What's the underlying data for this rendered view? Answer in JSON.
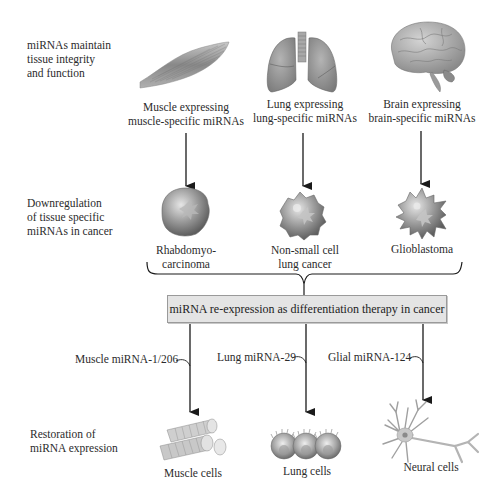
{
  "row_labels": {
    "top": [
      "miRNAs maintain",
      "tissue integrity",
      "and function"
    ],
    "middle": [
      "Downregulation",
      "of tissue specific",
      "miRNAs in cancer"
    ],
    "bottom": [
      "Restoration of",
      "miRNA expression"
    ]
  },
  "tissues": [
    {
      "icon": "muscle-icon",
      "caption": [
        "Muscle expressing",
        "muscle-specific miRNAs"
      ]
    },
    {
      "icon": "lungs-icon",
      "caption": [
        "Lung expressing",
        "lung-specific miRNAs"
      ]
    },
    {
      "icon": "brain-icon",
      "caption": [
        "Brain expressing",
        "brain-specific miRNAs"
      ]
    }
  ],
  "cancers": [
    {
      "icon": "rhabdomyosarcoma-cell-icon",
      "caption": [
        "Rhabdomyo-",
        "carcinoma"
      ]
    },
    {
      "icon": "nsclc-cell-icon",
      "caption": [
        "Non-small cell",
        "lung cancer"
      ]
    },
    {
      "icon": "glioblastoma-cell-icon",
      "caption": [
        "Glioblastoma"
      ]
    }
  ],
  "therapy_box": "miRNA re-expression as differentiation therapy in cancer",
  "mirnas": [
    {
      "label": "Muscle miRNA-1/206"
    },
    {
      "label": "Lung miRNA-29"
    },
    {
      "label": "Glial miRNA-124"
    }
  ],
  "restored_cells": [
    {
      "icon": "muscle-cells-icon",
      "caption": "Muscle cells"
    },
    {
      "icon": "lung-cells-icon",
      "caption": "Lung cells"
    },
    {
      "icon": "neural-cell-icon",
      "caption": "Neural cells"
    }
  ],
  "colors": {
    "arrow": "#1a1a1a",
    "box_fill": "#e4e4e4",
    "organ_gray": "#8a8a8a",
    "cell_gray": "#9c9c9c"
  }
}
